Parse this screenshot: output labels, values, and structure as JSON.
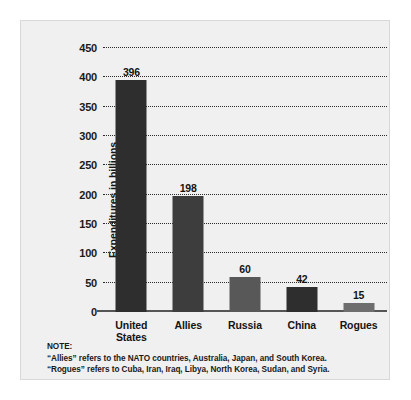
{
  "chart_data": {
    "type": "bar",
    "title": "",
    "xlabel": "",
    "ylabel": "Expenditures in billions",
    "ylim": [
      0,
      450
    ],
    "ytick_step": 50,
    "grid": true,
    "legend": "none",
    "categories": [
      "United States",
      "Allies",
      "Russia",
      "China",
      "Rogues"
    ],
    "values": [
      396,
      198,
      60,
      42,
      15
    ],
    "bar_colors": [
      "#2e2e2e",
      "#3d3d3d",
      "#585858",
      "#2e2e2e",
      "#6e6e6e"
    ],
    "ticks": [
      "0",
      "50",
      "100",
      "150",
      "200",
      "250",
      "300",
      "350",
      "400",
      "450"
    ],
    "bars": [
      {
        "label": "United\nStates",
        "value": 396,
        "value_text": "396",
        "color": "#2e2e2e"
      },
      {
        "label": "Allies",
        "value": 198,
        "value_text": "198",
        "color": "#3d3d3d"
      },
      {
        "label": "Russia",
        "value": 60,
        "value_text": "60",
        "color": "#585858"
      },
      {
        "label": "China",
        "value": 42,
        "value_text": "42",
        "color": "#2e2e2e"
      },
      {
        "label": "Rogues",
        "value": 15,
        "value_text": "15",
        "color": "#6e6e6e"
      }
    ]
  },
  "note": {
    "heading": "NOTE:",
    "lines": [
      "“Allies” refers to the NATO countries, Australia, Japan, and South Korea.",
      "“Rogues” refers to Cuba, Iran, Iraq, Libya, North Korea, Sudan, and Syria."
    ]
  },
  "colors": {
    "panel_background": "#f0f0f0",
    "grid": "#2b2b2b",
    "axis": "#555555",
    "text": "#141414"
  }
}
